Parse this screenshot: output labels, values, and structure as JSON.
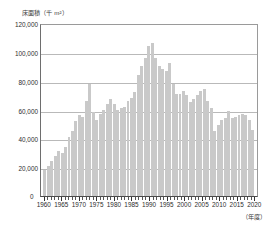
{
  "chart_data": {
    "type": "bar",
    "title": "",
    "ylabel": "床面積（千 m²）",
    "xlabel": "（年度）",
    "ylim": [
      0,
      120000
    ],
    "ytick_labels": [
      "120,000",
      "100,000",
      "80,000",
      "60,000",
      "40,000",
      "20,000",
      "0"
    ],
    "ytick_values": [
      120000,
      100000,
      80000,
      60000,
      40000,
      20000,
      0
    ],
    "xtick_labels": [
      "1960",
      "1965",
      "1970",
      "1975",
      "1980",
      "1985",
      "1990",
      "1995",
      "2000",
      "2005",
      "2010",
      "2015",
      "2020"
    ],
    "xtick_values": [
      1960,
      1965,
      1970,
      1975,
      1980,
      1985,
      1990,
      1995,
      2000,
      2005,
      2010,
      2015,
      2020
    ],
    "grid": true,
    "legend": "none",
    "bar_color": "#c9c9c9",
    "categories": [
      1960,
      1961,
      1962,
      1963,
      1964,
      1965,
      1966,
      1967,
      1968,
      1969,
      1970,
      1971,
      1972,
      1973,
      1974,
      1975,
      1976,
      1977,
      1978,
      1979,
      1980,
      1981,
      1982,
      1983,
      1984,
      1985,
      1986,
      1987,
      1988,
      1989,
      1990,
      1991,
      1992,
      1993,
      1994,
      1995,
      1996,
      1997,
      1998,
      1999,
      2000,
      2001,
      2002,
      2003,
      2004,
      2005,
      2006,
      2007,
      2008,
      2009,
      2010,
      2011,
      2012,
      2013,
      2014,
      2015,
      2016,
      2017,
      2018,
      2019,
      2020
    ],
    "values": [
      18000,
      21000,
      24000,
      28000,
      31000,
      30000,
      34000,
      41000,
      45000,
      52000,
      56000,
      55000,
      66000,
      78000,
      58000,
      53000,
      57000,
      60000,
      64000,
      67000,
      64000,
      60000,
      61000,
      62000,
      66000,
      68000,
      72000,
      84000,
      90000,
      96000,
      104000,
      106000,
      96000,
      90000,
      88000,
      87000,
      92000,
      78000,
      71000,
      71000,
      73000,
      70000,
      65000,
      67000,
      70000,
      73000,
      74000,
      66000,
      61000,
      45000,
      49000,
      53000,
      54000,
      59000,
      54000,
      55000,
      56000,
      57000,
      56000,
      53000,
      46000
    ],
    "unit": "千 m²"
  }
}
